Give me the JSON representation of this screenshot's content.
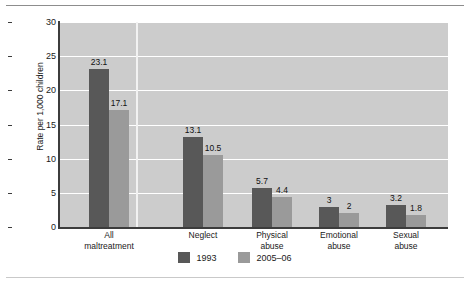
{
  "chart_data": {
    "type": "bar",
    "title": "",
    "subtitle": "",
    "xlabel": "",
    "ylabel": "Rate per 1,000 children",
    "ylim": [
      0,
      30
    ],
    "yticks": [
      0,
      5,
      10,
      15,
      20,
      25,
      30
    ],
    "ytick_labels": [
      "0",
      "5",
      "10",
      "15",
      "20",
      "25",
      "30"
    ],
    "grid": "horizontal",
    "legend_position": "bottom-center",
    "categories": [
      "All\nmaltreatment",
      "Neglect",
      "Physical\nabuse",
      "Emotional\nabuse",
      "Sexual\nabuse"
    ],
    "series": [
      {
        "name": "1993",
        "color": "#585858",
        "values": [
          23.1,
          13.1,
          5.7,
          3,
          3.2
        ],
        "value_labels": [
          "23.1",
          "13.1",
          "5.7",
          "3",
          "3.2"
        ]
      },
      {
        "name": "2005–06",
        "color": "#9a9a9a",
        "values": [
          17.1,
          10.5,
          4.4,
          2,
          1.8
        ],
        "value_labels": [
          "17.1",
          "10.5",
          "4.4",
          "2",
          "1.8"
        ]
      }
    ]
  },
  "legend": {
    "items": [
      {
        "label": "1993",
        "swatch": "legend-swatch-1993"
      },
      {
        "label": "2005–06",
        "swatch": "legend-swatch-2005-06"
      }
    ]
  },
  "colors": {
    "series_1993": "#585858",
    "series_2005_06": "#9a9a9a",
    "plot_background": "#cccccc",
    "gridline": "#ffffff",
    "axis": "#3c3c3c",
    "page_background": "#ffffff"
  }
}
